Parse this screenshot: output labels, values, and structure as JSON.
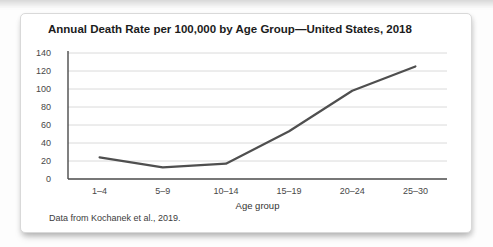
{
  "figure": {
    "title": "Annual Death Rate per 100,000 by Age Group—United States, 2018",
    "footnote": "Data from Kochanek et al., 2019."
  },
  "chart_data": {
    "type": "line",
    "title": "Annual Death Rate per 100,000 by Age Group—United States, 2018",
    "categories": [
      "1–4",
      "5–9",
      "10–14",
      "15–19",
      "20–24",
      "25–30"
    ],
    "values": [
      24,
      13,
      17,
      53,
      98,
      125
    ],
    "xlabel": "Age group",
    "ylabel": "",
    "ylim": [
      0,
      140
    ],
    "ytick_step": 20,
    "grid": true,
    "legend": "none",
    "line_color": "#4f4f4f",
    "axis_color": "#4a4a4a",
    "grid_color": "#dadada",
    "source_note": "Data from Kochanek et al., 2019."
  }
}
